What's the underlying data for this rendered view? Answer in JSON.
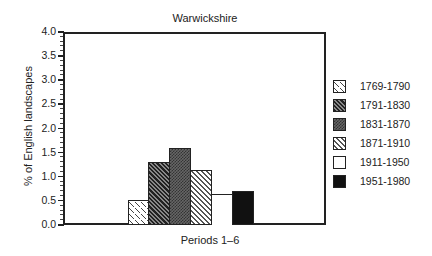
{
  "chart_data": {
    "type": "bar",
    "title": "Warwickshire",
    "xlabel": "Periods 1–6",
    "ylabel": "% of English landscapes",
    "ylim": [
      0,
      4.0
    ],
    "yticks": [
      "0.0",
      "0.5",
      "1.0",
      "1.5",
      "2.0",
      "2.5",
      "3.0",
      "3.5",
      "4.0"
    ],
    "grid": false,
    "legend_position": "right",
    "categories": [
      "1769-1790",
      "1791-1830",
      "1831-1870",
      "1871-1910",
      "1911-1950",
      "1951-1980"
    ],
    "values": [
      0.5,
      1.28,
      1.57,
      1.12,
      0.62,
      0.68
    ],
    "legend": [
      "1769-1790",
      "1791-1830",
      "1831-1870",
      "1871-1910",
      "1911-1950",
      "1951-1980"
    ]
  }
}
